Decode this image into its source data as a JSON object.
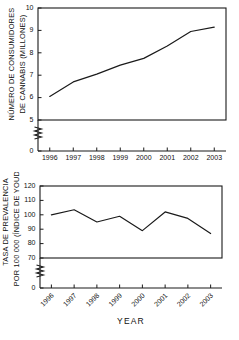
{
  "figure": {
    "background": "#ffffff",
    "ink_color": "#1a1a1a",
    "xlabel": "YEAR"
  },
  "chart_data": [
    {
      "id": "cannabis-users",
      "type": "line",
      "title": "",
      "xlabel": "",
      "ylabel": "NÚMERO DE CONSUMIDORES DE CANNABIS (MILLONES)",
      "ylabel_line1": "NÚMERO DE CONSUMIDORES",
      "ylabel_line2": "DE CANNABIS (MILLONES)",
      "categories": [
        "1996",
        "1997",
        "1998",
        "1999",
        "2000",
        "2001",
        "2002",
        "2003"
      ],
      "x": [
        1996,
        1997,
        1998,
        1999,
        2000,
        2001,
        2002,
        2003
      ],
      "values": [
        6.05,
        6.7,
        7.05,
        7.45,
        7.75,
        8.3,
        8.95,
        9.15
      ],
      "yticks": [
        0,
        5,
        6,
        7,
        8,
        9,
        10
      ],
      "ylim": [
        5,
        10
      ],
      "axis_break": true,
      "axis_break_between": [
        0,
        5
      ],
      "grid": false,
      "legend": "none",
      "series": [
        {
          "name": "Número de consumidores de cannabis (millones)",
          "values": [
            6.05,
            6.7,
            7.05,
            7.45,
            7.75,
            8.3,
            8.95,
            9.15
          ]
        }
      ]
    },
    {
      "id": "prevalence-rate",
      "type": "line",
      "title": "",
      "xlabel": "YEAR",
      "ylabel": "TASA DE PREVALENCIA POR 100 000 (ÍNDICE DE YOUDEN)",
      "ylabel_line1": "TASA DE PREVALENCIA",
      "ylabel_line2": "POR 100 000 (ÍNDICE DE YOUDEN)",
      "categories": [
        "1996",
        "1997",
        "1998",
        "1999",
        "2000",
        "2001",
        "2002",
        "2003"
      ],
      "x": [
        1996,
        1997,
        1998,
        1999,
        2000,
        2001,
        2002,
        2003
      ],
      "values": [
        100,
        103.5,
        95,
        99,
        89,
        102,
        97.5,
        87
      ],
      "yticks": [
        0,
        70,
        80,
        90,
        100,
        110,
        120
      ],
      "ylim": [
        70,
        120
      ],
      "axis_break": true,
      "axis_break_between": [
        0,
        70
      ],
      "grid": false,
      "legend": "none",
      "series": [
        {
          "name": "Tasa de prevalencia por 100 000 (índice de Youden)",
          "values": [
            100,
            103.5,
            95,
            99,
            89,
            102,
            97.5,
            87
          ]
        }
      ]
    }
  ]
}
